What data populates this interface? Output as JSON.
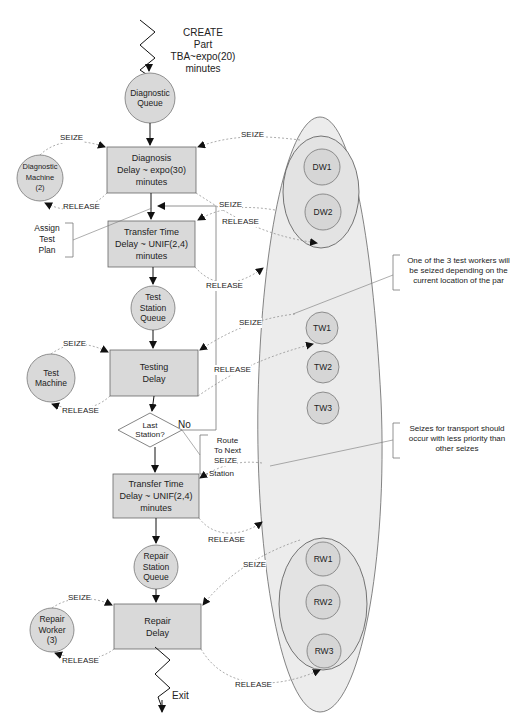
{
  "create": {
    "label": "CREATE\nPart\nTBA~expo(20)\nminutes"
  },
  "nodes": {
    "diagnostic_queue": "Diagnostic\nQueue",
    "diagnostic_machine": "Diagnostic\nMachine\n(2)",
    "test_station_queue": "Test\nStation\nQueue",
    "test_machine": "Test\nMachine",
    "repair_station_queue": "Repair\nStation\nQueue",
    "repair_worker": "Repair\nWorker\n(3)"
  },
  "boxes": {
    "diagnosis": "Diagnosis\nDelay ~ expo(30)\nminutes",
    "transfer1": "Transfer Time\nDelay ~ UNIF(2,4)\nminutes",
    "testing": "Testing\nDelay",
    "transfer2": "Transfer Time\nDelay ~ UNIF(2,4)\nminutes",
    "repair": "Repair\nDelay"
  },
  "decision": {
    "label": "Last\nStation?",
    "no_label": "No"
  },
  "brackets": {
    "assign_test_plan": "Assign\nTest\nPlan",
    "route_to_next_station_a": "Route\nTo Next",
    "route_to_next_station_b": "Station"
  },
  "workers": {
    "dw1": "DW1",
    "dw2": "DW2",
    "tw1": "TW1",
    "tw2": "TW2",
    "tw3": "TW3",
    "rw1": "RW1",
    "rw2": "RW2",
    "rw3": "RW3"
  },
  "actions": {
    "seize": "SEIZE",
    "release": "RELEASE"
  },
  "notes": {
    "test_workers": "One of the 3 test workers will\nbe seized depending on the\ncurrent location of the par",
    "transport_priority": "Seizes for transport should\noccur with less priority than\nother seizes"
  },
  "exit": {
    "label": "Exit"
  },
  "colors": {
    "fill": "#d9d9d9",
    "pool": "#ebebeb",
    "stroke": "#555555",
    "dashed": "#777777"
  }
}
